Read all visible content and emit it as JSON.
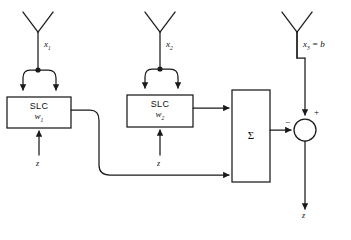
{
  "diagram": {
    "stroke_color": "#1a1a1a",
    "background": "#ffffff",
    "antennas": [
      {
        "name": "antenna-1",
        "label": "x",
        "subscript": "1",
        "x": 38,
        "apex_y": 32
      },
      {
        "name": "antenna-2",
        "label": "x",
        "subscript": "2",
        "x": 160,
        "apex_y": 32
      },
      {
        "name": "antenna-3",
        "label": "x",
        "subscript": "3",
        "suffix": " = b",
        "x": 297,
        "apex_y": 32
      }
    ],
    "blocks": [
      {
        "name": "slc-1",
        "top_label": "SLC",
        "bottom_label": "w",
        "bottom_sub": "1",
        "x": 7,
        "y": 97,
        "w": 64,
        "h": 31
      },
      {
        "name": "slc-2",
        "top_label": "SLC",
        "bottom_label": "w",
        "bottom_sub": "2",
        "x": 127,
        "y": 95,
        "w": 66,
        "h": 32
      },
      {
        "name": "summer",
        "label": "Σ",
        "x": 232,
        "y": 90,
        "w": 38,
        "h": 92
      }
    ],
    "junction": {
      "name": "summing-junction",
      "cx": 305,
      "cy": 130,
      "r": 11,
      "plus_sign": "+",
      "minus_sign": "−"
    },
    "inputs": [
      {
        "name": "noise-input-1",
        "label": "z",
        "x": 39,
        "y": 160
      },
      {
        "name": "noise-input-2",
        "label": "z",
        "x": 160,
        "y": 160
      }
    ],
    "output": {
      "name": "output-signal",
      "label": "z",
      "x": 305,
      "y": 214
    },
    "labels": {
      "x1": "x",
      "x1_sub": "1",
      "x2": "x",
      "x2_sub": "2",
      "x3": "x",
      "x3_sub": "3",
      "x3_eq": "= b",
      "z1": "z",
      "z2": "z",
      "z_out": "z",
      "slc": "SLC",
      "w1": "w",
      "w1_sub": "1",
      "w2": "w",
      "w2_sub": "2",
      "sigma": "Σ",
      "plus": "+",
      "minus": "−"
    }
  }
}
